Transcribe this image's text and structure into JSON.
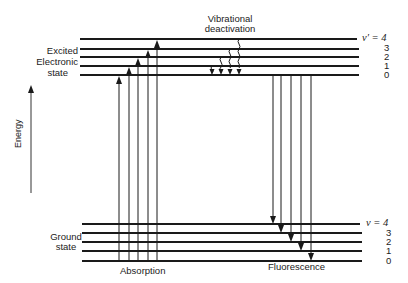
{
  "labels": {
    "excited_state": [
      "Excited",
      "Electronic",
      "state"
    ],
    "ground_state": [
      "Ground",
      "state"
    ],
    "vibrational_deactivation": [
      "Vibrational",
      "deactivation"
    ],
    "absorption": "Absorption",
    "fluorescence": "Fluorescence",
    "energy_axis": "Energy"
  },
  "excited_levels": {
    "symbol": "v′ = 4",
    "values": [
      "3",
      "2",
      "1",
      "0"
    ]
  },
  "ground_levels": {
    "symbol": "v = 4",
    "values": [
      "3",
      "2",
      "1",
      "0"
    ]
  },
  "colors": {
    "line": "#1a1a1a",
    "background": "#ffffff"
  }
}
